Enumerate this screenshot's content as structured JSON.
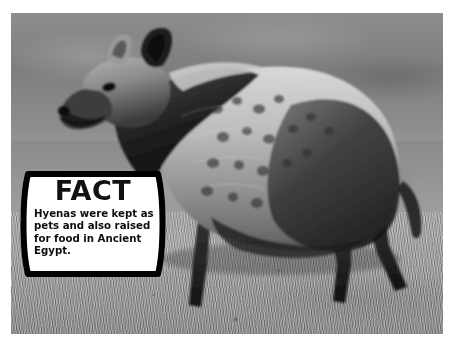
{
  "page": {
    "background_color": "#ffffff",
    "media_type": "photograph",
    "color_mode": "black-and-white"
  },
  "photo": {
    "subject": "spotted-hyena",
    "scene_description": "A spotted hyena standing in profile facing left on dry grassland savannah",
    "palette": {
      "background_gray": "#8b8b8b",
      "grass_gray": "#9c9c9c",
      "animal_light": "#c9c9c9",
      "animal_dark": "#1d1d1d",
      "frame_white": "#ffffff"
    }
  },
  "callout": {
    "heading": "FACT",
    "body": "Hyenas were kept as pets and also raised for food in Ancient Egypt.",
    "body_lines": [
      "Hyenas were kept as",
      "pets and also raised",
      "for food in Ancient",
      "Egypt."
    ],
    "fill_color": "#ffffff",
    "border_color": "#000000",
    "text_color": "#0d0d0d"
  }
}
